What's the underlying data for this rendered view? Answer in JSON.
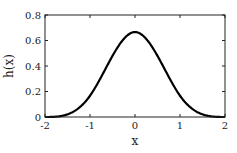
{
  "chart_data": {
    "type": "line",
    "title": "",
    "xlabel": "x",
    "ylabel": "h(x)",
    "xlim": [
      -2,
      2
    ],
    "ylim": [
      0,
      0.8
    ],
    "grid": false,
    "legend": null,
    "x_ticks": [
      -2,
      -1,
      0,
      1,
      2
    ],
    "x_tick_labels": [
      "-2",
      "-1",
      "0",
      "1",
      "2"
    ],
    "y_ticks": [
      0,
      0.2,
      0.4,
      0.6,
      0.8
    ],
    "y_tick_labels": [
      "0",
      "0.2",
      "0.4",
      "0.6",
      "0.8"
    ],
    "series": [
      {
        "name": "h(x)",
        "color": "#000000",
        "description": "cubic B-spline kernel, peak 2/3 at x=0, 1/6 at x=±1, 0 at x=±2",
        "x": [
          -2,
          -1.75,
          -1.5,
          -1.25,
          -1,
          -0.75,
          -0.5,
          -0.25,
          0,
          0.25,
          0.5,
          0.75,
          1,
          1.25,
          1.5,
          1.75,
          2
        ],
        "y": [
          0,
          0.0026,
          0.0208,
          0.0703,
          0.1667,
          0.3151,
          0.4792,
          0.612,
          0.6667,
          0.612,
          0.4792,
          0.3151,
          0.1667,
          0.0703,
          0.0208,
          0.0026,
          0
        ]
      }
    ]
  }
}
